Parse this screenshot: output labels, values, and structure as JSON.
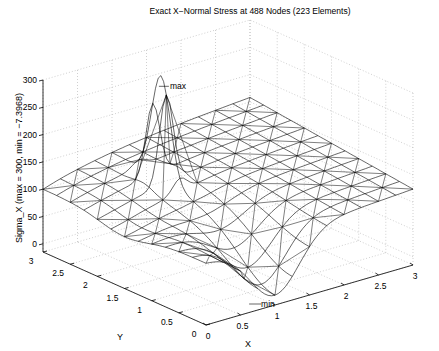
{
  "chart_data": {
    "type": "surface-mesh",
    "title": "Exact X−Normal Stress at 488 Nodes (223 Elements)",
    "xlabel": "X",
    "ylabel": "Y",
    "zlabel": "Sigma_X  (max = 300, min = −7.3968)",
    "xlim": [
      0,
      3
    ],
    "ylim": [
      0,
      3
    ],
    "zlim": [
      0,
      300
    ],
    "xticks": [
      "0",
      "0.5",
      "1",
      "1.5",
      "2",
      "2.5",
      "3"
    ],
    "yticks": [
      "0",
      "0.5",
      "1",
      "1.5",
      "2",
      "2.5",
      "3"
    ],
    "zticks": [
      "0",
      "50",
      "100",
      "150",
      "200",
      "250",
      "300"
    ],
    "grid": true,
    "nodes": 488,
    "elements": 223,
    "max": 300,
    "min": -7.3968,
    "annotations": [
      {
        "text": "max",
        "x": 1.0,
        "y": 2.1,
        "z": 300
      },
      {
        "text": "min",
        "x": 1.0,
        "y": 0.1,
        "z": -7.3968
      }
    ],
    "mesh_color": "#000000",
    "grid_color": "#b0b0b0"
  },
  "labels": {
    "title": "Exact X−Normal Stress at 488 Nodes (223 Elements)",
    "zlabel": "Sigma_X  (max = 300, min = −7.3968)",
    "xlabel": "X",
    "ylabel": "Y",
    "max": "max",
    "min": "min"
  }
}
